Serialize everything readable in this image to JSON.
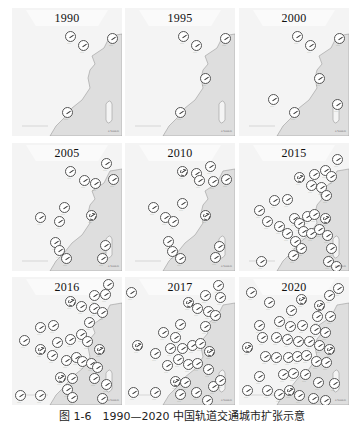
{
  "figure": {
    "caption": "图 1-6　1990—2020 中国轨道交通城市扩张示意",
    "colors": {
      "land": "#f4f4f4",
      "sea": "#dedede",
      "coast_stroke": "#9a9a9a",
      "circle_fill": "#ffffff",
      "circle_stroke": "#555555",
      "title_text": "#111111"
    },
    "panels": [
      {
        "year": "1990",
        "cities": [
          [
            58,
            28,
            0
          ],
          [
            71,
            37,
            0
          ],
          [
            100,
            30,
            0
          ],
          [
            55,
            104,
            0
          ]
        ]
      },
      {
        "year": "1995",
        "cities": [
          [
            58,
            28,
            0
          ],
          [
            71,
            37,
            0
          ],
          [
            100,
            30,
            0
          ],
          [
            80,
            70,
            0
          ],
          [
            55,
            104,
            0
          ]
        ]
      },
      {
        "year": "2000",
        "cities": [
          [
            58,
            28,
            0
          ],
          [
            71,
            37,
            0
          ],
          [
            100,
            30,
            0
          ],
          [
            80,
            70,
            0
          ],
          [
            34,
            91,
            0
          ],
          [
            98,
            96,
            0
          ],
          [
            55,
            104,
            0
          ]
        ]
      },
      {
        "year": "2005",
        "cities": [
          [
            94,
            20,
            0
          ],
          [
            58,
            28,
            0
          ],
          [
            72,
            37,
            0
          ],
          [
            83,
            40,
            0
          ],
          [
            101,
            36,
            0
          ],
          [
            52,
            64,
            0
          ],
          [
            28,
            74,
            0
          ],
          [
            79,
            72,
            1
          ],
          [
            47,
            78,
            0
          ],
          [
            43,
            99,
            0
          ],
          [
            47,
            107,
            0
          ],
          [
            54,
            115,
            0
          ],
          [
            93,
            102,
            0
          ],
          [
            90,
            115,
            0
          ]
        ]
      },
      {
        "year": "2010",
        "cities": [
          [
            57,
            28,
            1
          ],
          [
            71,
            30,
            0
          ],
          [
            85,
            23,
            0
          ],
          [
            74,
            37,
            0
          ],
          [
            88,
            38,
            0
          ],
          [
            101,
            36,
            0
          ],
          [
            28,
            64,
            0
          ],
          [
            57,
            60,
            0
          ],
          [
            40,
            74,
            0
          ],
          [
            48,
            78,
            0
          ],
          [
            80,
            72,
            1
          ],
          [
            43,
            98,
            0
          ],
          [
            47,
            108,
            0
          ],
          [
            55,
            115,
            0
          ],
          [
            94,
            103,
            0
          ],
          [
            90,
            114,
            0
          ]
        ]
      },
      {
        "year": "2015",
        "cities": [
          [
            98,
            16,
            0
          ],
          [
            60,
            34,
            1
          ],
          [
            75,
            31,
            0
          ],
          [
            86,
            27,
            0
          ],
          [
            92,
            33,
            0
          ],
          [
            72,
            42,
            0
          ],
          [
            82,
            44,
            0
          ],
          [
            87,
            52,
            0
          ],
          [
            20,
            67,
            0
          ],
          [
            35,
            57,
            0
          ],
          [
            48,
            56,
            0
          ],
          [
            28,
            78,
            0
          ],
          [
            40,
            83,
            0
          ],
          [
            55,
            75,
            0
          ],
          [
            60,
            80,
            0
          ],
          [
            68,
            73,
            0
          ],
          [
            75,
            71,
            0
          ],
          [
            86,
            75,
            1
          ],
          [
            64,
            88,
            0
          ],
          [
            72,
            90,
            0
          ],
          [
            80,
            86,
            0
          ],
          [
            88,
            92,
            0
          ],
          [
            48,
            90,
            0
          ],
          [
            56,
            98,
            0
          ],
          [
            62,
            105,
            0
          ],
          [
            54,
            112,
            0
          ],
          [
            22,
            118,
            0
          ],
          [
            92,
            105,
            0
          ],
          [
            89,
            118,
            0
          ],
          [
            97,
            123,
            0
          ]
        ]
      },
      {
        "year": "2016",
        "cities": [
          [
            96,
            7,
            0
          ],
          [
            58,
            24,
            1
          ],
          [
            82,
            18,
            0
          ],
          [
            93,
            17,
            0
          ],
          [
            69,
            29,
            0
          ],
          [
            82,
            31,
            0
          ],
          [
            90,
            35,
            0
          ],
          [
            77,
            45,
            0
          ],
          [
            28,
            50,
            0
          ],
          [
            41,
            48,
            0
          ],
          [
            12,
            63,
            0
          ],
          [
            28,
            72,
            1
          ],
          [
            40,
            78,
            0
          ],
          [
            45,
            65,
            0
          ],
          [
            58,
            62,
            0
          ],
          [
            69,
            57,
            0
          ],
          [
            75,
            64,
            0
          ],
          [
            87,
            72,
            1
          ],
          [
            54,
            83,
            0
          ],
          [
            64,
            80,
            0
          ],
          [
            70,
            84,
            0
          ],
          [
            79,
            86,
            0
          ],
          [
            85,
            90,
            0
          ],
          [
            48,
            100,
            1
          ],
          [
            60,
            101,
            0
          ],
          [
            55,
            112,
            0
          ],
          [
            60,
            120,
            0
          ],
          [
            82,
            101,
            0
          ],
          [
            94,
            107,
            0
          ],
          [
            8,
            118,
            0
          ],
          [
            28,
            118,
            0
          ],
          [
            90,
            121,
            0
          ]
        ]
      },
      {
        "year": "2017",
        "cities": [
          [
            6,
            15,
            0
          ],
          [
            93,
            8,
            0
          ],
          [
            63,
            25,
            1
          ],
          [
            80,
            18,
            0
          ],
          [
            95,
            20,
            0
          ],
          [
            72,
            31,
            0
          ],
          [
            83,
            34,
            0
          ],
          [
            90,
            38,
            0
          ],
          [
            80,
            49,
            0
          ],
          [
            55,
            47,
            0
          ],
          [
            38,
            55,
            0
          ],
          [
            50,
            60,
            0
          ],
          [
            12,
            68,
            1
          ],
          [
            30,
            76,
            0
          ],
          [
            45,
            71,
            0
          ],
          [
            57,
            71,
            0
          ],
          [
            67,
            68,
            0
          ],
          [
            75,
            66,
            0
          ],
          [
            84,
            74,
            1
          ],
          [
            42,
            88,
            0
          ],
          [
            53,
            82,
            0
          ],
          [
            63,
            87,
            0
          ],
          [
            72,
            86,
            0
          ],
          [
            83,
            92,
            0
          ],
          [
            50,
            104,
            1
          ],
          [
            60,
            105,
            0
          ],
          [
            55,
            117,
            0
          ],
          [
            71,
            115,
            0
          ],
          [
            88,
            109,
            0
          ],
          [
            8,
            115,
            0
          ],
          [
            30,
            115,
            0
          ],
          [
            82,
            123,
            0
          ],
          [
            95,
            103,
            0
          ]
        ]
      },
      {
        "year": "2020",
        "cities": [
          [
            12,
            15,
            0
          ],
          [
            30,
            25,
            0
          ],
          [
            52,
            33,
            0
          ],
          [
            62,
            22,
            1
          ],
          [
            80,
            28,
            1
          ],
          [
            90,
            18,
            0
          ],
          [
            99,
            11,
            0
          ],
          [
            78,
            39,
            0
          ],
          [
            91,
            39,
            0
          ],
          [
            20,
            48,
            0
          ],
          [
            40,
            44,
            0
          ],
          [
            51,
            49,
            0
          ],
          [
            63,
            48,
            0
          ],
          [
            76,
            52,
            0
          ],
          [
            86,
            55,
            0
          ],
          [
            8,
            70,
            1
          ],
          [
            23,
            60,
            0
          ],
          [
            37,
            60,
            0
          ],
          [
            48,
            62,
            0
          ],
          [
            59,
            64,
            0
          ],
          [
            70,
            64,
            0
          ],
          [
            80,
            68,
            0
          ],
          [
            90,
            72,
            1
          ],
          [
            26,
            79,
            0
          ],
          [
            37,
            80,
            0
          ],
          [
            49,
            80,
            0
          ],
          [
            58,
            79,
            0
          ],
          [
            67,
            78,
            0
          ],
          [
            77,
            84,
            0
          ],
          [
            87,
            85,
            0
          ],
          [
            44,
            97,
            0
          ],
          [
            54,
            96,
            0
          ],
          [
            66,
            97,
            0
          ],
          [
            79,
            105,
            0
          ],
          [
            20,
            99,
            0
          ],
          [
            8,
            113,
            0
          ],
          [
            28,
            113,
            0
          ],
          [
            40,
            117,
            0
          ],
          [
            50,
            113,
            1
          ],
          [
            60,
            118,
            0
          ],
          [
            74,
            121,
            0
          ],
          [
            86,
            123,
            0
          ],
          [
            95,
            106,
            0
          ]
        ]
      }
    ],
    "scale_label": "0 500km"
  }
}
